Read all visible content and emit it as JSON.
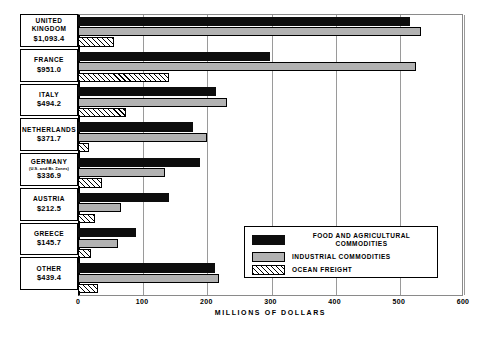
{
  "chart_data": {
    "type": "bar",
    "orientation": "horizontal",
    "title": "",
    "xlabel": "MILLIONS OF DOLLARS",
    "ylabel": "",
    "xlim": [
      0,
      600
    ],
    "xticks": [
      0,
      100,
      200,
      300,
      400,
      500,
      600
    ],
    "grid": true,
    "legend_position": "inside-right",
    "categories": [
      "UNITED KINGDOM",
      "FRANCE",
      "ITALY",
      "NETHERLANDS",
      "GERMANY",
      "AUSTRIA",
      "GREECE",
      "OTHER"
    ],
    "series": [
      {
        "name": "FOOD AND AGRICULTURAL COMMODITIES",
        "color": "#0d0d0d",
        "values": [
          517.0,
          299.0,
          215.0,
          179.0,
          190.0,
          142.0,
          90.0,
          213.0
        ]
      },
      {
        "name": "INDUSTRIAL COMMODITIES",
        "color": "#b2b2b2",
        "values": [
          534.0,
          527.0,
          232.0,
          201.0,
          136.0,
          67.0,
          62.0,
          220.0
        ]
      },
      {
        "name": "OCEAN FREIGHT",
        "color": "hatch",
        "values": [
          56.0,
          142.0,
          75.0,
          17.0,
          37.0,
          27.0,
          20.0,
          31.0
        ]
      }
    ]
  },
  "rows": [
    {
      "name": "UNITED KINGDOM",
      "sub": "",
      "total": "$1,093.4"
    },
    {
      "name": "FRANCE",
      "sub": "",
      "total": "$951.0"
    },
    {
      "name": "ITALY",
      "sub": "",
      "total": "$494.2"
    },
    {
      "name": "NETHERLANDS",
      "sub": "",
      "total": "$371.7"
    },
    {
      "name": "GERMANY",
      "sub": "(U.S. and Br. Zones)",
      "total": "$336.9"
    },
    {
      "name": "AUSTRIA",
      "sub": "",
      "total": "$212.5"
    },
    {
      "name": "GREECE",
      "sub": "",
      "total": "$145.7"
    },
    {
      "name": "OTHER",
      "sub": "",
      "total": "$439.4"
    }
  ],
  "legend": {
    "items": [
      {
        "label_line1": "FOOD AND AGRICULTURAL",
        "label_line2": "COMMODITIES",
        "swatch": "food"
      },
      {
        "label_line1": "INDUSTRIAL COMMODITIES",
        "label_line2": "",
        "swatch": "ind"
      },
      {
        "label_line1": "OCEAN FREIGHT",
        "label_line2": "",
        "swatch": "freight"
      }
    ]
  },
  "axis": {
    "title": "MILLIONS OF DOLLARS",
    "tick_labels": [
      "0",
      "100",
      "200",
      "300",
      "400",
      "500",
      "600"
    ]
  },
  "colors": {
    "food": "#0d0d0d",
    "industrial": "#b2b2b2",
    "freight_outline": "#000000",
    "frame": "#8a8a8a",
    "grid": "#9a9a9a"
  }
}
